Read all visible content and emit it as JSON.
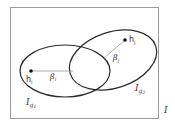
{
  "diagram": {
    "type": "venn-ellipses",
    "frame_label": "I",
    "sets": [
      {
        "name": "g1",
        "label_main": "I",
        "label_sub": "g",
        "label_subsub": "1"
      },
      {
        "name": "g2",
        "label_main": "I",
        "label_sub": "g",
        "label_subsub": "2"
      }
    ],
    "points": [
      {
        "name": "h_i",
        "label_main": "h",
        "label_sub": "i"
      },
      {
        "name": "h_j",
        "label_main": "h",
        "label_sub": "j"
      }
    ],
    "distances": [
      {
        "name": "beta_i",
        "label_main": "β",
        "label_sub": "i"
      },
      {
        "name": "beta_j",
        "label_main": "β",
        "label_sub": "j"
      }
    ],
    "colors": {
      "stroke": "#2b2b2b",
      "frame": "#9a9a9a",
      "guide_line": "#9a9a9a",
      "label": "#333333"
    }
  }
}
